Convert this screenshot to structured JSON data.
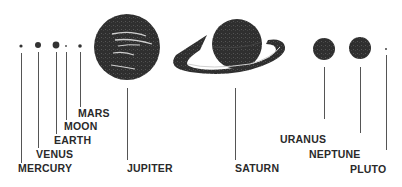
{
  "diagram": {
    "title": "",
    "colors": {
      "planet": "#2f2f2f",
      "ink": "#2a2a2a",
      "background": "#ffffff"
    },
    "planets": [
      {
        "name": "MERCURY"
      },
      {
        "name": "VENUS"
      },
      {
        "name": "EARTH"
      },
      {
        "name": "MOON"
      },
      {
        "name": "MARS"
      },
      {
        "name": "JUPITER"
      },
      {
        "name": "SATURN"
      },
      {
        "name": "URANUS"
      },
      {
        "name": "NEPTUNE"
      },
      {
        "name": "PLUTO"
      }
    ]
  }
}
